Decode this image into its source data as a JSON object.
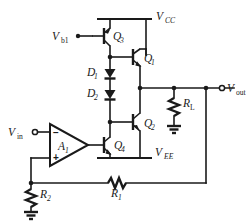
{
  "diagram": {
    "type": "schematic",
    "background_color": "#ffffff",
    "line_color": "#1a1a1a"
  },
  "supplies": {
    "positive": {
      "name": "V",
      "subscript": "CC"
    },
    "negative": {
      "name": "V",
      "subscript": "EE"
    }
  },
  "terminals": {
    "input": {
      "name": "V",
      "subscript": "in"
    },
    "output": {
      "name": "V",
      "subscript": "out"
    },
    "bias": {
      "name": "V",
      "subscript": "b1"
    }
  },
  "transistors": [
    {
      "id": "q1",
      "name": "Q",
      "subscript": "1",
      "type": "npn"
    },
    {
      "id": "q2",
      "name": "Q",
      "subscript": "2",
      "type": "pnp"
    },
    {
      "id": "q3",
      "name": "Q",
      "subscript": "3",
      "type": "pnp"
    },
    {
      "id": "q4",
      "name": "Q",
      "subscript": "4",
      "type": "npn"
    }
  ],
  "diodes": [
    {
      "id": "d1",
      "name": "D",
      "subscript": "1"
    },
    {
      "id": "d2",
      "name": "D",
      "subscript": "2"
    }
  ],
  "resistors": [
    {
      "id": "rl",
      "name": "R",
      "subscript": "L",
      "orientation": "vertical"
    },
    {
      "id": "r1",
      "name": "R",
      "subscript": "1",
      "orientation": "horizontal"
    },
    {
      "id": "r2",
      "name": "R",
      "subscript": "2",
      "orientation": "vertical"
    }
  ],
  "amplifier": {
    "name": "A",
    "subscript": "1",
    "inverting_label": "−",
    "noninverting_label": "+"
  },
  "grounds": [
    {
      "id": "ground-rl"
    },
    {
      "id": "ground-r2"
    }
  ]
}
